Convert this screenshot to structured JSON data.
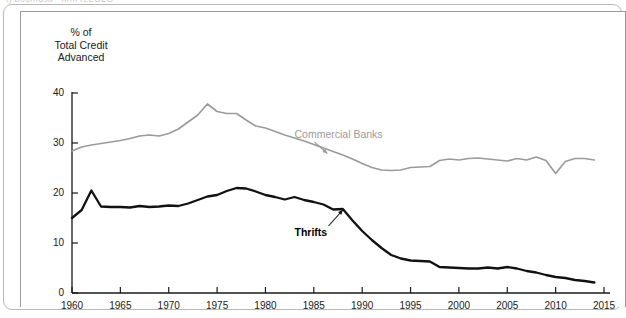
{
  "page": {
    "top_caption": "f) boomusu  · firm reLGLO"
  },
  "colors": {
    "thrifts": "#111111",
    "commercial_banks": "#9b9b9b",
    "axis": "#1a1a1a",
    "frame": "#9a9a9a",
    "panel_border": "#b9b9b9",
    "background": "#ffffff"
  },
  "chart_data": {
    "type": "line",
    "title": "",
    "subtitle": "",
    "ylabel": "% of\nTotal Credit\nAdvanced",
    "xlabel": "",
    "xlim": [
      1960,
      2015
    ],
    "ylim": [
      0,
      40
    ],
    "grid": false,
    "legend": "inline-annotations",
    "yticks": [
      0,
      10,
      20,
      30,
      40
    ],
    "ytick_labels": [
      "0",
      "10",
      "20",
      "30",
      "40"
    ],
    "xticks": [
      1960,
      1965,
      1970,
      1975,
      1980,
      1985,
      1990,
      1995,
      2000,
      2005,
      2010,
      2015
    ],
    "xtick_labels": [
      "1960",
      "1965",
      "1970",
      "1975",
      "1980",
      "1985",
      "1990",
      "1995",
      "2000",
      "2005",
      "2010",
      "2015"
    ],
    "annotations": [
      {
        "text": "Commercial Banks",
        "x": 1983.0,
        "y": 31.6,
        "points_to_x": 1986.4,
        "points_to_y": 27.9
      },
      {
        "text": "Thrifts",
        "x": 1983.0,
        "y": 12.0,
        "points_to_x": 1988.0,
        "points_to_y": 16.6
      }
    ],
    "series": [
      {
        "name": "Commercial Banks",
        "color": "#9b9b9b",
        "x": [
          1960,
          1961,
          1962,
          1963,
          1964,
          1965,
          1966,
          1967,
          1968,
          1969,
          1970,
          1971,
          1972,
          1973,
          1974,
          1975,
          1976,
          1977,
          1978,
          1979,
          1980,
          1981,
          1982,
          1983,
          1984,
          1985,
          1986,
          1987,
          1988,
          1989,
          1990,
          1991,
          1992,
          1993,
          1994,
          1995,
          1996,
          1997,
          1998,
          1999,
          2000,
          2001,
          2002,
          2003,
          2004,
          2005,
          2006,
          2007,
          2008,
          2009,
          2010,
          2011,
          2012,
          2013,
          2014
        ],
        "values": [
          28.4,
          29.2,
          29.6,
          29.9,
          30.2,
          30.5,
          30.9,
          31.4,
          31.6,
          31.4,
          31.9,
          32.8,
          34.2,
          35.6,
          37.8,
          36.3,
          35.9,
          35.9,
          34.6,
          33.4,
          33.0,
          32.3,
          31.6,
          31.0,
          30.4,
          29.7,
          29.0,
          28.3,
          27.6,
          26.8,
          25.9,
          25.1,
          24.6,
          24.5,
          24.6,
          25.1,
          25.2,
          25.3,
          26.5,
          26.8,
          26.6,
          26.9,
          27.0,
          26.8,
          26.6,
          26.4,
          26.9,
          26.6,
          27.2,
          26.5,
          23.9,
          26.3,
          26.9,
          26.9,
          26.6
        ]
      },
      {
        "name": "Thrifts",
        "color": "#111111",
        "x": [
          1960,
          1961,
          1962,
          1963,
          1964,
          1965,
          1966,
          1967,
          1968,
          1969,
          1970,
          1971,
          1972,
          1973,
          1974,
          1975,
          1976,
          1977,
          1978,
          1979,
          1980,
          1981,
          1982,
          1983,
          1984,
          1985,
          1986,
          1987,
          1988,
          1989,
          1990,
          1991,
          1992,
          1993,
          1994,
          1995,
          1996,
          1997,
          1998,
          1999,
          2000,
          2001,
          2002,
          2003,
          2004,
          2005,
          2006,
          2007,
          2008,
          2009,
          2010,
          2011,
          2012,
          2013,
          2014
        ],
        "values": [
          15.0,
          16.6,
          20.5,
          17.3,
          17.2,
          17.2,
          17.1,
          17.4,
          17.2,
          17.3,
          17.5,
          17.4,
          17.9,
          18.6,
          19.3,
          19.6,
          20.4,
          21.0,
          20.9,
          20.3,
          19.6,
          19.2,
          18.7,
          19.2,
          18.6,
          18.2,
          17.7,
          16.7,
          16.8,
          14.5,
          12.4,
          10.6,
          9.0,
          7.6,
          6.9,
          6.5,
          6.4,
          6.3,
          5.2,
          5.1,
          5.0,
          4.9,
          4.9,
          5.1,
          4.9,
          5.2,
          4.9,
          4.4,
          4.1,
          3.6,
          3.2,
          3.0,
          2.6,
          2.4,
          2.1
        ]
      }
    ]
  }
}
